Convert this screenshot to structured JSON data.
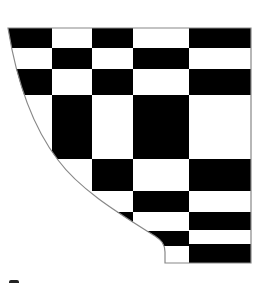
{
  "figure": {
    "colors": {
      "fill": "#000000",
      "background": "#ffffff",
      "outline": "#888888"
    },
    "columns_x": [
      8,
      52,
      92,
      133,
      189,
      251
    ],
    "cells": [
      {
        "col": 0,
        "y0": 28,
        "y1": 48,
        "color": "B"
      },
      {
        "col": 1,
        "y0": 28,
        "y1": 48,
        "color": "W"
      },
      {
        "col": 2,
        "y0": 28,
        "y1": 48,
        "color": "B"
      },
      {
        "col": 3,
        "y0": 28,
        "y1": 48,
        "color": "W"
      },
      {
        "col": 4,
        "y0": 28,
        "y1": 48,
        "color": "B"
      },
      {
        "col": 0,
        "y0": 48,
        "y1": 69,
        "color": "W"
      },
      {
        "col": 1,
        "y0": 48,
        "y1": 69,
        "color": "B"
      },
      {
        "col": 2,
        "y0": 48,
        "y1": 69,
        "color": "W"
      },
      {
        "col": 3,
        "y0": 48,
        "y1": 69,
        "color": "B"
      },
      {
        "col": 4,
        "y0": 48,
        "y1": 69,
        "color": "W"
      },
      {
        "col": 0,
        "y0": 69,
        "y1": 95,
        "color": "B"
      },
      {
        "col": 1,
        "y0": 69,
        "y1": 95,
        "color": "W"
      },
      {
        "col": 2,
        "y0": 69,
        "y1": 95,
        "color": "B"
      },
      {
        "col": 3,
        "y0": 69,
        "y1": 95,
        "color": "W"
      },
      {
        "col": 4,
        "y0": 69,
        "y1": 95,
        "color": "B"
      },
      {
        "col": 0,
        "y0": 95,
        "y1": 159,
        "color": "W"
      },
      {
        "col": 1,
        "y0": 95,
        "y1": 159,
        "color": "B"
      },
      {
        "col": 2,
        "y0": 95,
        "y1": 159,
        "color": "W"
      },
      {
        "col": 3,
        "y0": 95,
        "y1": 159,
        "color": "B"
      },
      {
        "col": 4,
        "y0": 95,
        "y1": 159,
        "color": "W"
      },
      {
        "col": 1,
        "y0": 159,
        "y1": 191,
        "color": "W"
      },
      {
        "col": 2,
        "y0": 159,
        "y1": 191,
        "color": "B"
      },
      {
        "col": 3,
        "y0": 159,
        "y1": 191,
        "color": "W"
      },
      {
        "col": 4,
        "y0": 159,
        "y1": 191,
        "color": "B"
      },
      {
        "col": 2,
        "y0": 191,
        "y1": 212,
        "color": "W"
      },
      {
        "col": 3,
        "y0": 191,
        "y1": 212,
        "color": "B"
      },
      {
        "col": 4,
        "y0": 191,
        "y1": 212,
        "color": "W"
      },
      {
        "col": 2,
        "y0": 212,
        "y1": 231,
        "color": "B"
      },
      {
        "col": 3,
        "y0": 212,
        "y1": 231,
        "color": "W"
      },
      {
        "col": 4,
        "y0": 212,
        "y1": 230,
        "color": "B"
      },
      {
        "col": 3,
        "y0": 231,
        "y1": 246,
        "color": "B"
      },
      {
        "col": 4,
        "y0": 230,
        "y1": 244,
        "color": "W"
      },
      {
        "col": 3,
        "y0": 246,
        "y1": 263,
        "color": "W"
      },
      {
        "col": 4,
        "y0": 244,
        "y1": 263,
        "color": "B"
      }
    ],
    "clip_path": "M8,28 L251,28 L251,263 L165,263 L165,252 C165,244 161,240 155,236 C120,214 80,190 58,160 C35,130 18,90 8,28 Z"
  }
}
